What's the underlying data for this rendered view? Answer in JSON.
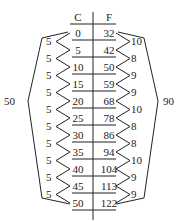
{
  "headers": {
    "c": "C",
    "f": "F"
  },
  "rows": [
    {
      "c": "0",
      "f": "32"
    },
    {
      "c": "5",
      "f": "42"
    },
    {
      "c": "10",
      "f": "50"
    },
    {
      "c": "15",
      "f": "59"
    },
    {
      "c": "20",
      "f": "68"
    },
    {
      "c": "25",
      "f": "78"
    },
    {
      "c": "30",
      "f": "86"
    },
    {
      "c": "35",
      "f": "94"
    },
    {
      "c": "40",
      "f": "104"
    },
    {
      "c": "45",
      "f": "113"
    },
    {
      "c": "50",
      "f": "122"
    }
  ],
  "left_diffs": [
    "5",
    "5",
    "5",
    "5",
    "5",
    "5",
    "5",
    "5",
    "5",
    "5"
  ],
  "right_diffs": [
    "10",
    "8",
    "9",
    "9",
    "10",
    "8",
    "8",
    "10",
    "9",
    "9"
  ],
  "left_total": "50",
  "right_total": "90",
  "colors": {
    "ink": "#222222",
    "background": "#ffffff"
  }
}
